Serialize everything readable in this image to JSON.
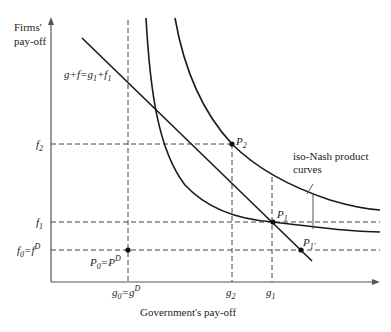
{
  "axes": {
    "y_label_line1": "Firms'",
    "y_label_line2": "pay-off",
    "x_label": "Government's pay-off"
  },
  "y_ticks": {
    "f2": {
      "base": "f",
      "sub": "2"
    },
    "f1": {
      "base": "f",
      "sub": "1"
    },
    "f0": {
      "base": "f",
      "sub": "0",
      "eq": "=f",
      "sup": "D"
    }
  },
  "x_ticks": {
    "g0": {
      "base": "g",
      "sub": "0",
      "eq": "=g",
      "sup": "D"
    },
    "g2": {
      "base": "g",
      "sub": "2"
    },
    "g1": {
      "base": "g",
      "sub": "1"
    }
  },
  "line_label": {
    "text1": "g+f=g",
    "sub1": "1",
    "text2": "+f",
    "sub2": "1"
  },
  "points": {
    "P0": {
      "base": "P",
      "sub": "0",
      "eq": "=P",
      "sup": "D"
    },
    "P1": {
      "base": "P",
      "sub": "1"
    },
    "P2": {
      "base": "P",
      "sub": "2"
    },
    "P1prime": {
      "base": "P",
      "sub": "1'"
    }
  },
  "annotation": {
    "line1": "iso-Nash product",
    "line2": "curves"
  },
  "colors": {
    "curve": "#1a1a1a",
    "axis": "#555555",
    "dashed": "#444444"
  }
}
